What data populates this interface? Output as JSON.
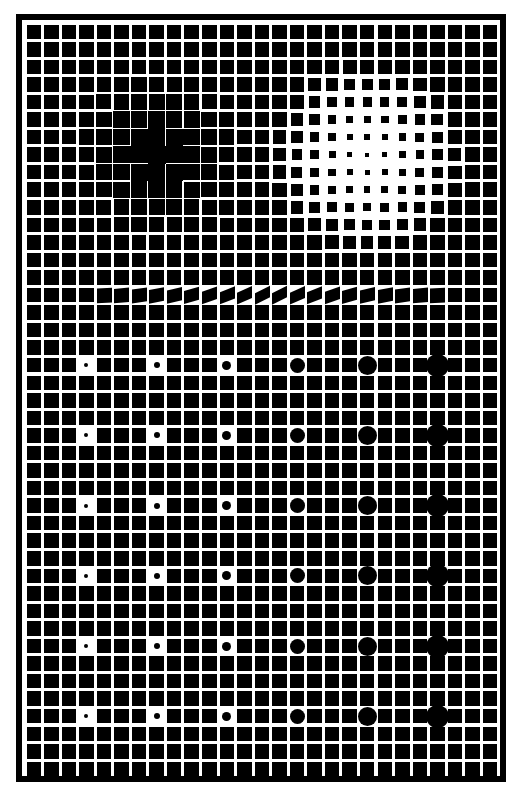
{
  "artwork": {
    "frame": {
      "x": 16,
      "y": 14,
      "w": 490,
      "h": 768,
      "border": 6
    },
    "grid": {
      "x0": 26.5,
      "y0": 24.5,
      "pitch": 17.55,
      "cols": 27,
      "rows": 43,
      "square": 14.5
    },
    "dark_blob": {
      "cx": 157,
      "cy": 155,
      "radius": 90,
      "max_grow": 3.5
    },
    "light_blob": {
      "cx": 368,
      "cy": 158,
      "radius": 95,
      "max_shrink": 11
    },
    "skew_row": {
      "row": 15,
      "col_start": 3,
      "col_end": 24
    },
    "dot_columns": [
      3,
      7,
      11,
      15,
      19,
      23
    ],
    "dot_rows": [
      19,
      23,
      27,
      31,
      35,
      39
    ],
    "dot_diameters": [
      4,
      6,
      9,
      15,
      19,
      23
    ],
    "colors": {
      "ink": "#000000",
      "paper": "#ffffff"
    }
  }
}
